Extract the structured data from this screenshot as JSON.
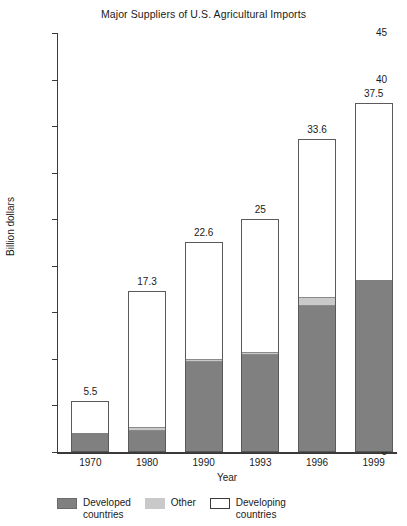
{
  "chart_data": {
    "type": "bar",
    "subtype": "stacked-vertical",
    "title": "Major Suppliers of U.S. Agricultural Imports",
    "xlabel": "Year",
    "ylabel": "Billion dollars",
    "categories": [
      "1970",
      "1980",
      "1990",
      "1993",
      "1996",
      "1999"
    ],
    "ylim": [
      0,
      45
    ],
    "yticks": [
      "0",
      "5",
      "10",
      "15",
      "20",
      "25",
      "30",
      "35",
      "40",
      "45"
    ],
    "grid": false,
    "legend_position": "bottom",
    "series": [
      {
        "name": "Developed countries",
        "color": "#808080",
        "values": [
          2.0,
          2.2,
          9.6,
          10.4,
          15.7,
          18.5
        ]
      },
      {
        "name": "Other",
        "color": "#c9c9c9",
        "values": [
          0.0,
          0.4,
          0.35,
          0.35,
          0.9,
          0.0
        ]
      },
      {
        "name": "Developing countries",
        "color": "#ffffff",
        "values": [
          3.5,
          14.7,
          12.65,
          14.25,
          17.0,
          19.0
        ]
      }
    ],
    "totals": [
      "5.5",
      "17.3",
      "22.6",
      "25",
      "33.6",
      "37.5"
    ],
    "total_values": [
      5.5,
      17.3,
      22.6,
      25.0,
      33.6,
      37.5
    ]
  },
  "legend": {
    "items": [
      {
        "label": "Developed\ncountries",
        "line1": "Developed",
        "line2": "countries"
      },
      {
        "label": "Other",
        "line1": "Other",
        "line2": ""
      },
      {
        "label": "Developing\ncountries",
        "line1": "Developing",
        "line2": "countries"
      }
    ]
  }
}
